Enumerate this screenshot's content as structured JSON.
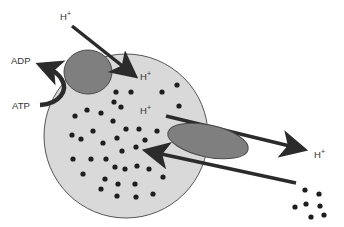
{
  "diagram": {
    "colors": {
      "cell_fill": "#d9d9d9",
      "cell_stroke": "#555555",
      "pump_fill": "#7f7f7f",
      "carrier_fill": "#7f7f7f",
      "arrow": "#2b2b2b",
      "dot": "#1e1e1e",
      "text": "#333333"
    },
    "labels": {
      "adp": "ADP",
      "atp": "ATP",
      "h_ion": "H",
      "plus": "+",
      "h_top": "H+",
      "h_inside_1": "H+",
      "h_inside_2": "H+",
      "h_outside_right": "H+"
    },
    "cell": {
      "cx": 126,
      "cy": 136,
      "r": 82
    },
    "pump": {
      "cx": 88,
      "cy": 72,
      "rx": 24,
      "ry": 22
    },
    "carrier": {
      "cx": 208,
      "cy": 141,
      "rx": 40,
      "ry": 16,
      "rotate": 12
    },
    "inside_dots": [
      [
        116,
        92
      ],
      [
        131,
        92
      ],
      [
        162,
        92
      ],
      [
        177,
        85
      ],
      [
        114,
        102
      ],
      [
        121,
        107
      ],
      [
        179,
        106
      ],
      [
        87,
        110
      ],
      [
        101,
        113
      ],
      [
        75,
        116
      ],
      [
        113,
        121
      ],
      [
        126,
        129
      ],
      [
        139,
        129
      ],
      [
        93,
        131
      ],
      [
        157,
        131
      ],
      [
        72,
        135
      ],
      [
        81,
        139
      ],
      [
        117,
        138
      ],
      [
        145,
        140
      ],
      [
        103,
        143
      ],
      [
        136,
        147
      ],
      [
        122,
        151
      ],
      [
        73,
        159
      ],
      [
        91,
        159
      ],
      [
        106,
        159
      ],
      [
        137,
        166
      ],
      [
        115,
        167
      ],
      [
        125,
        169
      ],
      [
        149,
        169
      ],
      [
        83,
        174
      ],
      [
        163,
        177
      ],
      [
        105,
        179
      ],
      [
        118,
        184
      ],
      [
        135,
        184
      ],
      [
        101,
        189
      ],
      [
        117,
        196
      ],
      [
        136,
        197
      ],
      [
        153,
        194
      ]
    ],
    "outside_dots": [
      [
        305,
        190
      ],
      [
        319,
        194
      ],
      [
        295,
        207
      ],
      [
        306,
        204
      ],
      [
        320,
        206
      ],
      [
        311,
        217
      ],
      [
        324,
        215
      ]
    ]
  }
}
